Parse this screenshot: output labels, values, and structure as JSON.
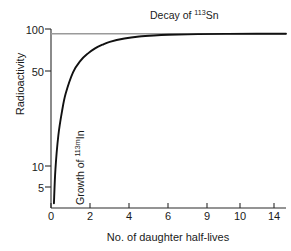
{
  "chart_data": {
    "type": "line",
    "title": "",
    "xlabel": "No. of daughter half-lives",
    "ylabel": "Radioactivity",
    "yscale": "log",
    "ylim": [
      3,
      110
    ],
    "xlim": [
      0,
      16
    ],
    "grid": false,
    "legend_position": "inline-annotations",
    "y_ticks": [
      "5",
      "10",
      "50",
      "100"
    ],
    "y_tick_values": [
      5,
      10,
      50,
      100
    ],
    "x_ticks": [
      "0",
      "2",
      "4",
      "6",
      "9",
      "10",
      "14"
    ],
    "x_tick_values": [
      0,
      2,
      4,
      6,
      8,
      10,
      12
    ],
    "annotations": [
      {
        "name": "decay-label",
        "text_prefix": "Decay of ",
        "superscript": "113",
        "text_suffix": "Sn"
      },
      {
        "name": "growth-label",
        "text_prefix": "Growth of ",
        "superscript": "113m",
        "text_suffix": "In"
      }
    ],
    "series": [
      {
        "name": "Decay of 113Sn",
        "color": "#9a9a9a",
        "x": [
          0,
          2,
          4,
          6,
          8,
          10,
          12,
          14,
          16
        ],
        "values": [
          100,
          100,
          100,
          100,
          100,
          100,
          100,
          100,
          100
        ]
      },
      {
        "name": "Growth of 113mIn",
        "color": "#111111",
        "x": [
          0.2,
          0.3,
          0.5,
          0.75,
          1,
          1.5,
          2,
          2.5,
          3,
          3.5,
          4,
          5,
          6,
          7,
          8,
          10,
          12,
          14,
          16
        ],
        "values": [
          3.3,
          6.5,
          12.9,
          21.0,
          30.0,
          46.0,
          58.0,
          67.0,
          74.5,
          80.2,
          85.0,
          90.8,
          94.5,
          96.6,
          97.9,
          99.2,
          99.7,
          99.9,
          100
        ]
      }
    ]
  }
}
